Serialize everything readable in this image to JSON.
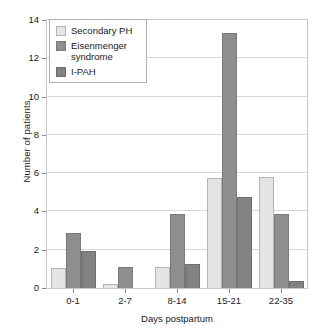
{
  "chart_data": {
    "type": "bar",
    "title": "",
    "xlabel": "Days postpartum",
    "ylabel": "Number of patients",
    "categories": [
      "0-1",
      "2-7",
      "8-14",
      "15-21",
      "22-35"
    ],
    "series": [
      {
        "name": "Secondary PH",
        "color": "#e4e4e4",
        "values": [
          1.05,
          0.2,
          1.1,
          5.75,
          5.8
        ]
      },
      {
        "name": "Eisenmenger syndrome",
        "color": "#8e8e8e",
        "values": [
          2.85,
          1.1,
          3.85,
          13.3,
          3.85
        ]
      },
      {
        "name": "I-PAH",
        "color": "#828282",
        "values": [
          1.95,
          0,
          1.25,
          4.75,
          0.35
        ]
      }
    ],
    "ylim": [
      0,
      14
    ],
    "yticks": [
      0,
      2,
      4,
      6,
      8,
      10,
      12,
      14
    ],
    "ytick_labels": [
      "0",
      "2",
      "4",
      "6",
      "8",
      "10",
      "12",
      "14"
    ],
    "grid": true,
    "legend_position": "top-left-inside"
  },
  "legend": {
    "entries": [
      {
        "label": "Secondary PH"
      },
      {
        "label": "Eisenmenger\nsyndrome"
      },
      {
        "label": "I-PAH"
      }
    ]
  }
}
